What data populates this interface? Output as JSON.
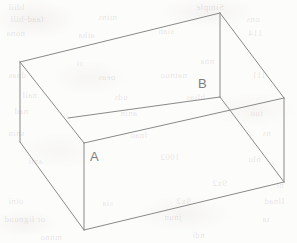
{
  "figure": {
    "background_color": "#fcfcfb",
    "line_color": "#8a8a8a",
    "label_color": "#7e7e7e",
    "width": 297,
    "height": 243
  },
  "labels": [
    {
      "text": "A",
      "x": 90,
      "y": 150,
      "vertex": "front-left-inner-top-corner"
    },
    {
      "text": "B",
      "x": 198,
      "y": 77,
      "vertex": "back-right-inner-top-corner"
    }
  ],
  "ghost_text": [
    {
      "text": "ldiil",
      "x": 8,
      "y": 2
    },
    {
      "text": "Simple",
      "x": 196,
      "y": 2
    },
    {
      "text": "faad-hill",
      "x": 10,
      "y": 14
    },
    {
      "text": "mins",
      "x": 98,
      "y": 12
    },
    {
      "text": "ons",
      "x": 246,
      "y": 14
    },
    {
      "text": "nona",
      "x": 6,
      "y": 28
    },
    {
      "text": "atha",
      "x": 78,
      "y": 30
    },
    {
      "text": "sian",
      "x": 158,
      "y": 26
    },
    {
      "text": "114",
      "x": 248,
      "y": 28
    },
    {
      "text": "ri",
      "x": 76,
      "y": 58
    },
    {
      "text": "nna",
      "x": 200,
      "y": 56
    },
    {
      "text": "dnas",
      "x": 8,
      "y": 70
    },
    {
      "text": "oeas",
      "x": 98,
      "y": 72
    },
    {
      "text": "natnuo",
      "x": 160,
      "y": 70
    },
    {
      "text": "111",
      "x": 252,
      "y": 70
    },
    {
      "text": "nail",
      "x": 22,
      "y": 90
    },
    {
      "text": "uds",
      "x": 114,
      "y": 92
    },
    {
      "text": "hlias",
      "x": 186,
      "y": 92
    },
    {
      "text": "nad",
      "x": 14,
      "y": 106
    },
    {
      "text": "anin",
      "x": 120,
      "y": 108
    },
    {
      "text": "tuo",
      "x": 250,
      "y": 108
    },
    {
      "text": "snin",
      "x": 8,
      "y": 128
    },
    {
      "text": "lnao",
      "x": 130,
      "y": 130
    },
    {
      "text": "ns",
      "x": 262,
      "y": 128
    },
    {
      "text": "ami",
      "x": 28,
      "y": 156
    },
    {
      "text": "1002",
      "x": 160,
      "y": 152
    },
    {
      "text": "nlo",
      "x": 248,
      "y": 154
    },
    {
      "text": "9x2",
      "x": 212,
      "y": 178
    },
    {
      "text": "ni",
      "x": 276,
      "y": 180
    },
    {
      "text": "otni",
      "x": 8,
      "y": 196
    },
    {
      "text": "sia",
      "x": 102,
      "y": 198
    },
    {
      "text": "9x2",
      "x": 176,
      "y": 196
    },
    {
      "text": "Ilnad",
      "x": 264,
      "y": 196
    },
    {
      "text": "or lignuod",
      "x": 4,
      "y": 214
    },
    {
      "text": "jnun",
      "x": 164,
      "y": 212
    },
    {
      "text": "ta",
      "x": 262,
      "y": 214
    },
    {
      "text": "mnno",
      "x": 40,
      "y": 232
    },
    {
      "text": "ndi",
      "x": 192,
      "y": 230
    }
  ],
  "geometry": {
    "projection": "oblique",
    "shape": "open-top rectangular box",
    "vertices": {
      "back_top_left": {
        "x": 20,
        "y": 62
      },
      "back_top_right": {
        "x": 220,
        "y": 13
      },
      "front_top_left": {
        "x": 84,
        "y": 143
      },
      "front_top_right": {
        "x": 284,
        "y": 98
      },
      "back_bottom_left": {
        "x": 20,
        "y": 142
      },
      "back_bottom_right": {
        "x": 220,
        "y": 97
      },
      "front_bottom_left": {
        "x": 84,
        "y": 230
      },
      "front_bottom_right": {
        "x": 284,
        "y": 182
      },
      "inner_back_left": {
        "x": 68,
        "y": 118
      }
    },
    "edges": [
      {
        "name": "rim-back",
        "from": "back_top_left",
        "to": "back_top_right"
      },
      {
        "name": "rim-left",
        "from": "back_top_left",
        "to": "front_top_left"
      },
      {
        "name": "rim-right",
        "from": "back_top_right",
        "to": "front_top_right"
      },
      {
        "name": "rim-front",
        "from": "front_top_left",
        "to": "front_top_right"
      },
      {
        "name": "wall-left-vertical",
        "from": "back_top_left",
        "to": "back_bottom_left"
      },
      {
        "name": "wall-corner-vertical-A",
        "from": "front_top_left",
        "to": "front_bottom_left"
      },
      {
        "name": "wall-corner-vertical-B",
        "from": "back_top_right",
        "to": "back_bottom_right"
      },
      {
        "name": "wall-right-vertical",
        "from": "front_top_right",
        "to": "front_bottom_right"
      },
      {
        "name": "base-front-left",
        "from": "back_bottom_left",
        "to": "front_bottom_left"
      },
      {
        "name": "base-front",
        "from": "front_bottom_left",
        "to": "front_bottom_right"
      },
      {
        "name": "inner-floor-back",
        "from": "inner_back_left",
        "to": "back_bottom_right"
      },
      {
        "name": "inner-floor-right",
        "from": "back_bottom_right",
        "to": "front_bottom_right"
      }
    ]
  }
}
